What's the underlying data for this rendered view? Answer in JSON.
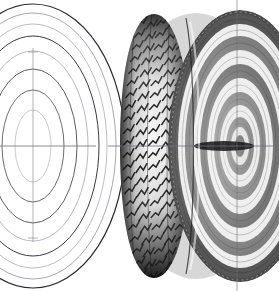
{
  "figure": {
    "background_color": "#ffffff",
    "width": 279,
    "height": 291,
    "ink_color": "#1a1a1a",
    "line_color": "#6a6a78",
    "faint_line_color": "#b9b9c4",
    "axis_color": "#8a8a96",
    "subjects": [
      {
        "name": "wireframe-tire",
        "label": "Wireframe construction tire (left)",
        "style": "line-art outline",
        "center": {
          "x": 33,
          "y": 146
        },
        "cropped_at_left_edge": true,
        "ellipse_rings": [
          {
            "rx": 92,
            "ry": 142,
            "stroke": "#2b2b33",
            "width": 1.2
          },
          {
            "rx": 83,
            "ry": 133,
            "stroke": "#8f8f9c",
            "width": 0.8
          },
          {
            "rx": 74,
            "ry": 122,
            "stroke": "#9d9daa",
            "width": 0.7
          },
          {
            "rx": 66,
            "ry": 110,
            "stroke": "#3a3a44",
            "width": 1.0
          },
          {
            "rx": 55,
            "ry": 95,
            "stroke": "#9a9aa6",
            "width": 0.7
          },
          {
            "rx": 44,
            "ry": 77,
            "stroke": "#4a4a55",
            "width": 0.9
          },
          {
            "rx": 31,
            "ry": 56,
            "stroke": "#5a5a66",
            "width": 0.9
          },
          {
            "rx": 18,
            "ry": 36,
            "stroke": "#b4b4c0",
            "width": 0.7
          }
        ],
        "axis": {
          "vertical": {
            "x": 33,
            "y1": 48,
            "y2": 242
          },
          "tick_top_y": 52,
          "tick_bottom_y": 238
        }
      },
      {
        "name": "rendered-tire",
        "label": "Rendered shaded tire with wheel (right)",
        "style": "airbrush halftone rendering",
        "center": {
          "x": 240,
          "y": 146
        },
        "tread_face": {
          "left_edge_x": 122,
          "right_edge_x": 186,
          "top_y": 14,
          "bottom_y": 278,
          "pattern": "diagonal zigzag chevron blocks",
          "block_rows": 22,
          "block_cols": 5
        },
        "sidewall_bands": [
          {
            "rx": 68,
            "ry": 132,
            "tone": "#3b3b3b"
          },
          {
            "rx": 62,
            "ry": 122,
            "tone": "#f2f2f2"
          },
          {
            "rx": 55,
            "ry": 110,
            "tone": "#6a6a6a"
          },
          {
            "rx": 47,
            "ry": 96,
            "tone": "#efefef"
          },
          {
            "rx": 40,
            "ry": 82,
            "tone": "#4f4f4f"
          },
          {
            "rx": 33,
            "ry": 68,
            "tone": "#ededed"
          },
          {
            "rx": 26,
            "ry": 54,
            "tone": "#5c5c5c"
          },
          {
            "rx": 20,
            "ry": 41,
            "tone": "#e8e8e8"
          },
          {
            "rx": 14,
            "ry": 29,
            "tone": "#4a4a4a"
          },
          {
            "rx": 9,
            "ry": 19,
            "tone": "#d8d8d8"
          },
          {
            "rx": 5,
            "ry": 11,
            "tone": "#2a2a2a"
          }
        ],
        "hub": {
          "x": 240,
          "y": 146,
          "rx": 8,
          "ry": 13,
          "color": "#1d1d1d"
        }
      }
    ],
    "centerlines": {
      "horizontal": {
        "y": 146,
        "segments": [
          {
            "x1": 0,
            "x2": 96
          },
          {
            "x1": 108,
            "x2": 279
          }
        ]
      },
      "vertical_right": {
        "x": 237,
        "y1": 0,
        "y2": 291
      }
    }
  }
}
